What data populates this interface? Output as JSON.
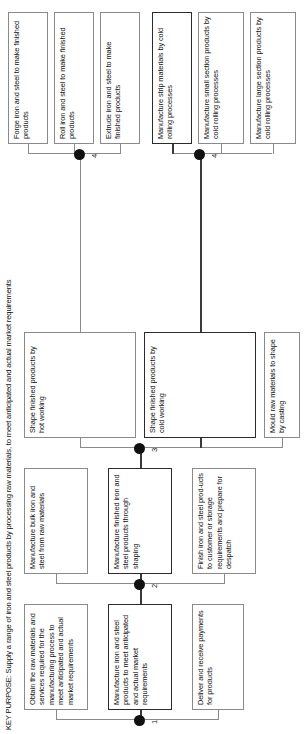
{
  "diagram": {
    "type": "functional-analysis-tree",
    "orientation": "rotated-90-ccw",
    "title": "KEY PURPOSE: Supply a range of iron and steel products by processing raw materials, to meet anticipated and actual market requirements",
    "level_markers": [
      "1",
      "2",
      "3",
      "4",
      "4"
    ],
    "colors": {
      "box_border": "#8a8a8a",
      "key_path_border": "#2b2b2b",
      "connector": "#8a8a8a",
      "junction_dot": "#111111",
      "background": "#ffffff",
      "text": "#111111"
    },
    "level1": [
      {
        "id": "l1-a",
        "label": "Obtain the raw materials and services required for the manufacturing process to meet anticipated and actual market requirements",
        "key_path": false
      },
      {
        "id": "l1-b",
        "label": "Manufacture iron and steel products to meet anticipated and actual market requirements",
        "key_path": true
      },
      {
        "id": "l1-c",
        "label": "Deliver and receive payments for products",
        "key_path": false
      }
    ],
    "level2": [
      {
        "id": "l2-a",
        "label": "Manufacture bulk iron and steel from raw materials",
        "key_path": false
      },
      {
        "id": "l2-b",
        "label": "Manufacture finished iron and steel products through shaping",
        "key_path": true
      },
      {
        "id": "l2-c",
        "label": "Finish iron and steel prod-ucts to customer or storage requirements and prepare for despatch",
        "key_path": false
      }
    ],
    "level3": [
      {
        "id": "l3-a",
        "label": "Shape finished products by hot working",
        "key_path": false
      },
      {
        "id": "l3-b",
        "label": "Shape finished products by cold working",
        "key_path": true
      },
      {
        "id": "l3-c",
        "label": "Mould raw materials to shape by casting",
        "key_path": false
      }
    ],
    "level4_hot": [
      {
        "id": "l4h-a",
        "label": "Forge iron and steel to make finished products",
        "key_path": false
      },
      {
        "id": "l4h-b",
        "label": "Roll iron and steel to make finished products",
        "key_path": false
      },
      {
        "id": "l4h-c",
        "label": "Extrude iron and steel  to make finished products",
        "key_path": false
      }
    ],
    "level4_cold": [
      {
        "id": "l4c-a",
        "label": "Manufacture strip materials by cold rolling processes",
        "key_path": true
      },
      {
        "id": "l4c-b",
        "label": "Manufacture small section products by cold rolling processes",
        "key_path": false
      },
      {
        "id": "l4c-c",
        "label": "Manufacture large section products by cold rolling processes",
        "key_path": false
      }
    ]
  }
}
